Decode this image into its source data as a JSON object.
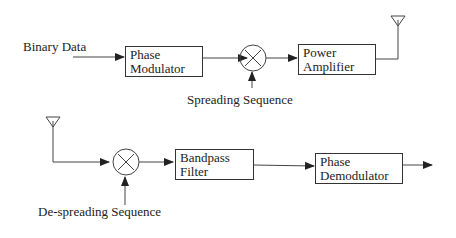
{
  "transmitter": {
    "input_label": "Binary Data",
    "modulator": [
      "Phase",
      "Modulator"
    ],
    "spreading_label": "Spreading Sequence",
    "amplifier": [
      "Power",
      "Amplifier"
    ]
  },
  "receiver": {
    "despreading_label": "De-spreading Sequence",
    "filter": [
      "Bandpass",
      "Filter"
    ],
    "demodulator": [
      "Phase",
      "Demodulator"
    ]
  }
}
